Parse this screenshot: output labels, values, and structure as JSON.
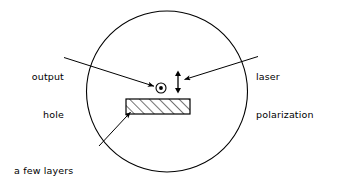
{
  "figure": {
    "type": "schematic-diagram",
    "stroke_color": "#000000",
    "background_color": "#ffffff"
  },
  "labels": {
    "output_hole": {
      "line1": "output",
      "line2": "hole"
    },
    "laser_polarization": {
      "line1": "laser",
      "line2": "polarization"
    },
    "masking_tapes": {
      "line1": "a few layers",
      "line2": "of masking tapes"
    }
  },
  "elements": {
    "outer_circle": {
      "name": "outer-circle",
      "cx": 167,
      "cy": 91.5,
      "r": 80.5
    },
    "tape_rectangle": {
      "name": "hatched-tape-rectangle",
      "x": 126,
      "y": 99,
      "width": 64,
      "height": 15,
      "hatch": "diagonal"
    },
    "output_hole_symbol": {
      "name": "output-hole-symbol",
      "cx": 161,
      "cy": 88,
      "r_outer": 5,
      "r_inner": 1.9
    },
    "polarization_arrow": {
      "name": "polarization-double-arrow",
      "x": 178,
      "y_top": 71,
      "y_bottom": 93
    }
  }
}
